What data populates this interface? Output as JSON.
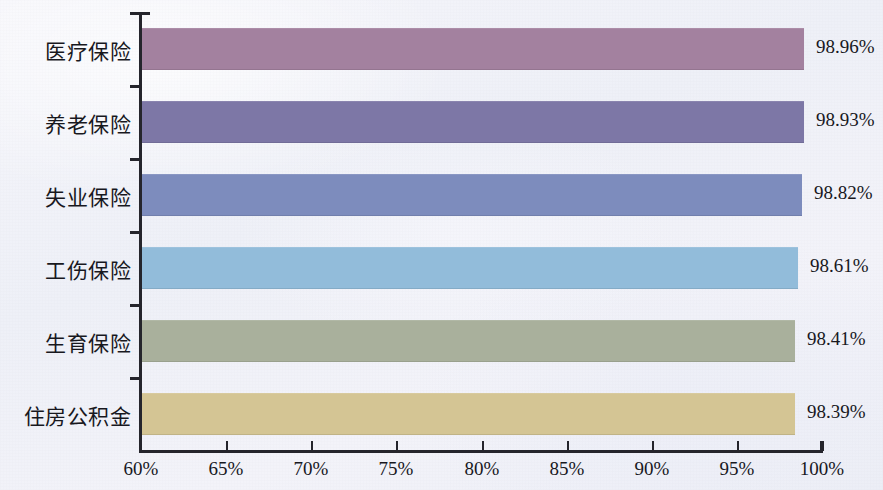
{
  "chart_data": {
    "type": "bar",
    "orientation": "horizontal",
    "title": "",
    "subtitle": "",
    "xlabel": "",
    "ylabel": "",
    "xlim": [
      60,
      100
    ],
    "grid": false,
    "legend": "none",
    "x_tick_labels": [
      "60%",
      "65%",
      "70%",
      "75%",
      "80%",
      "85%",
      "90%",
      "95%",
      "100%"
    ],
    "x_tick_values": [
      60,
      65,
      70,
      75,
      80,
      85,
      90,
      95,
      100
    ],
    "categories": [
      "医疗保险",
      "养老保险",
      "失业保险",
      "工伤保险",
      "生育保险",
      "住房公积金"
    ],
    "values": [
      98.96,
      98.93,
      98.82,
      98.61,
      98.41,
      98.39
    ],
    "value_labels": [
      "98.96%",
      "98.93%",
      "98.82%",
      "98.61%",
      "98.41%",
      "98.39%"
    ],
    "bar_colors": [
      "#a3819f",
      "#7d77a6",
      "#7d8cbd",
      "#92bcda",
      "#a9b09c",
      "#d4c594"
    ],
    "background_color": "#f1f1f8",
    "axis_color": "#25252c",
    "text_color": "#18181e"
  }
}
